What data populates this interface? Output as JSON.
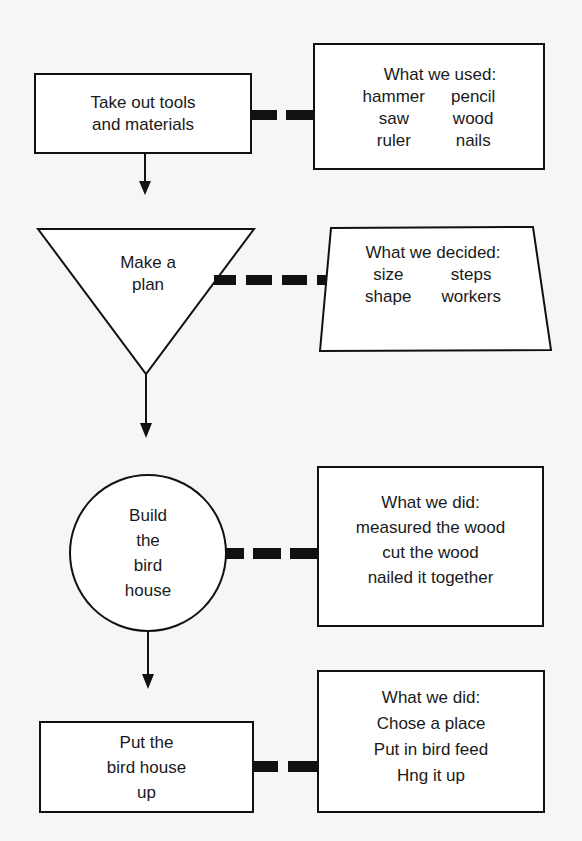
{
  "diagram": {
    "type": "flowchart",
    "colors": {
      "background": "#f7f6f4",
      "stroke": "#111111",
      "text": "#1a1a1a"
    },
    "steps": [
      {
        "shape": "rectangle",
        "label_lines": [
          "Take out tools",
          "and materials"
        ],
        "note": {
          "shape": "rectangle",
          "heading": "What we used:",
          "items": [
            "hammer",
            "pencil",
            "saw",
            "wood",
            "ruler",
            "nails"
          ],
          "layout": "two-column"
        }
      },
      {
        "shape": "inverted-triangle",
        "label_lines": [
          "Make a",
          "plan"
        ],
        "note": {
          "shape": "trapezoid",
          "heading": "What we decided:",
          "items": [
            "size",
            "steps",
            "shape",
            "workers"
          ],
          "layout": "two-column"
        }
      },
      {
        "shape": "circle",
        "label_lines": [
          "Build",
          "the",
          "bird",
          "house"
        ],
        "note": {
          "shape": "rectangle",
          "heading": "What we did:",
          "items": [
            "measured the wood",
            "cut the wood",
            "nailed it together"
          ],
          "layout": "single-column"
        }
      },
      {
        "shape": "rectangle",
        "label_lines": [
          "Put the",
          "bird house",
          "up"
        ],
        "note": {
          "shape": "rectangle",
          "heading": "What we did:",
          "items": [
            "Chose a place",
            "Put in bird feed",
            "Hng it up"
          ],
          "layout": "single-column"
        }
      }
    ],
    "connectors": {
      "flow": "solid arrows downward between steps",
      "notes": "thick dashed lines linking each step to its note"
    }
  }
}
